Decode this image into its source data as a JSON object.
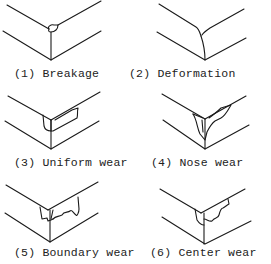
{
  "diagram": {
    "panels": [
      {
        "number": "(1)",
        "label": "Breakage",
        "caption": "(1) Breakage"
      },
      {
        "number": "(2)",
        "label": "Deformation",
        "caption": "(2) Deformation"
      },
      {
        "number": "(3)",
        "label": "Uniform wear",
        "caption": "(3) Uniform wear"
      },
      {
        "number": "(4)",
        "label": "Nose wear",
        "caption": "(4) Nose wear"
      },
      {
        "number": "(5)",
        "label": "Boundary wear",
        "caption": "(5) Boundary wear"
      },
      {
        "number": "(6)",
        "label": "Center wear",
        "caption": "(6) Center wear"
      }
    ],
    "line_color": "#1a1a1a",
    "background": "#ffffff"
  }
}
